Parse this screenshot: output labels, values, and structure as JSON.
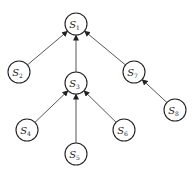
{
  "diagram": {
    "type": "tree",
    "direction": "child-to-parent arrows",
    "node_radius": 11,
    "nodes": [
      {
        "id": "S1",
        "base": "S",
        "sub": "1",
        "x": 76,
        "y": 24
      },
      {
        "id": "S2",
        "base": "S",
        "sub": "2",
        "x": 19,
        "y": 72
      },
      {
        "id": "S3",
        "base": "S",
        "sub": "3",
        "x": 76,
        "y": 83
      },
      {
        "id": "S7",
        "base": "S",
        "sub": "7",
        "x": 134,
        "y": 72
      },
      {
        "id": "S8",
        "base": "S",
        "sub": "8",
        "x": 175,
        "y": 110
      },
      {
        "id": "S4",
        "base": "S",
        "sub": "4",
        "x": 27,
        "y": 130
      },
      {
        "id": "S6",
        "base": "S",
        "sub": "6",
        "x": 124,
        "y": 130
      },
      {
        "id": "S5",
        "base": "S",
        "sub": "5",
        "x": 76,
        "y": 154
      }
    ],
    "edges": [
      {
        "from": "S2",
        "to": "S1"
      },
      {
        "from": "S3",
        "to": "S1"
      },
      {
        "from": "S7",
        "to": "S1"
      },
      {
        "from": "S8",
        "to": "S7"
      },
      {
        "from": "S4",
        "to": "S3"
      },
      {
        "from": "S5",
        "to": "S3"
      },
      {
        "from": "S6",
        "to": "S3"
      }
    ]
  }
}
